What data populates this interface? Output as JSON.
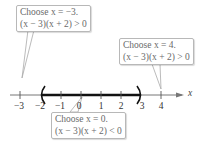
{
  "number_line": {
    "variable": "x",
    "ticks": [
      "−3",
      "−2",
      "−1",
      "0",
      "1",
      "2",
      "3",
      "4"
    ],
    "interval": {
      "left": "(",
      "right": ")",
      "from": "−2",
      "to": "3"
    }
  },
  "callouts": [
    {
      "line1": "Choose x = −3.",
      "line2": "(x − 3)(x + 2) > 0"
    },
    {
      "line1": "Choose x = 4.",
      "line2": "(x − 3)(x + 2) > 0"
    },
    {
      "line1": "Choose x = 0.",
      "line2": "(x − 3)(x + 2) < 0"
    }
  ]
}
